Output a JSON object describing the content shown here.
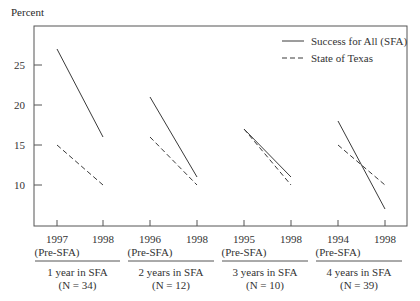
{
  "chart_data": {
    "type": "line",
    "title": "",
    "ylabel": "Percent",
    "xlabel": "",
    "ylim": [
      5,
      30
    ],
    "yticks": [
      10,
      15,
      20,
      25
    ],
    "grid": false,
    "legend_position": "top-right",
    "legend": [
      {
        "name": "Success for All (SFA)",
        "style": "solid"
      },
      {
        "name": "State of Texas",
        "style": "dashed"
      }
    ],
    "panels": [
      {
        "group_label": "1 year in SFA",
        "n_label": "(N = 34)",
        "x": [
          "1997 (Pre-SFA)",
          "1998"
        ],
        "series": [
          {
            "name": "Success for All (SFA)",
            "values": [
              27,
              16
            ]
          },
          {
            "name": "State of Texas",
            "values": [
              15,
              10
            ]
          }
        ]
      },
      {
        "group_label": "2 years in SFA",
        "n_label": "(N = 12)",
        "x": [
          "1996 (Pre-SFA)",
          "1998"
        ],
        "series": [
          {
            "name": "Success for All (SFA)",
            "values": [
              21,
              11
            ]
          },
          {
            "name": "State of Texas",
            "values": [
              16,
              10
            ]
          }
        ]
      },
      {
        "group_label": "3 years in SFA",
        "n_label": "(N = 10)",
        "x": [
          "1995 (Pre-SFA)",
          "1998"
        ],
        "series": [
          {
            "name": "Success for All (SFA)",
            "values": [
              17,
              11
            ]
          },
          {
            "name": "State of Texas",
            "values": [
              17,
              10
            ]
          }
        ]
      },
      {
        "group_label": "4 years in SFA",
        "n_label": "(N = 39)",
        "x": [
          "1994 (Pre-SFA)",
          "1998"
        ],
        "series": [
          {
            "name": "Success for All (SFA)",
            "values": [
              18,
              7
            ]
          },
          {
            "name": "State of Texas",
            "values": [
              15,
              10
            ]
          }
        ]
      }
    ]
  },
  "labels": {
    "ylabel": "Percent",
    "pre_sfa": "(Pre-SFA)",
    "legend_solid": "Success for All (SFA)",
    "legend_dashed": "State of Texas"
  },
  "colors": {
    "line": "#3a3a3a",
    "axis": "#555555"
  }
}
